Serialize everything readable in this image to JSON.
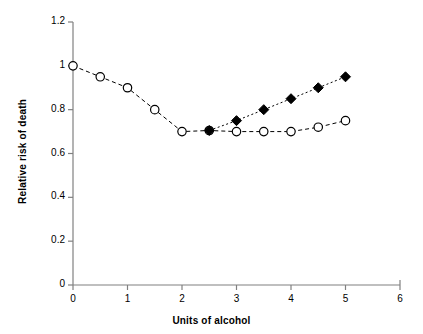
{
  "chart_data": {
    "type": "line",
    "title": "",
    "xlabel": "Units of alcohol",
    "ylabel": "Relative risk of death",
    "xlim": [
      0,
      6
    ],
    "ylim": [
      0,
      1.2
    ],
    "xticks": [
      "0",
      "1",
      "2",
      "3",
      "4",
      "5",
      "6"
    ],
    "xtick_values": [
      0,
      1,
      2,
      3,
      4,
      5,
      6
    ],
    "yticks": [
      "0",
      "0.2",
      "0.4",
      "0.6",
      "0.8",
      "1",
      "1.2"
    ],
    "ytick_values": [
      0,
      0.2,
      0.4,
      0.6,
      0.8,
      1,
      1.2
    ],
    "grid": false,
    "legend": "none",
    "series": [
      {
        "name": "open-circle-series",
        "marker": "open-circle",
        "line_style": "dashed",
        "color": "#000000",
        "x": [
          0,
          0.5,
          1,
          1.5,
          2,
          2.5,
          3,
          3.5,
          4,
          4.5,
          5
        ],
        "values": [
          1.0,
          0.95,
          0.9,
          0.8,
          0.7,
          0.705,
          0.7,
          0.7,
          0.7,
          0.72,
          0.75
        ]
      },
      {
        "name": "filled-diamond-series",
        "marker": "filled-diamond",
        "line_style": "dotted",
        "color": "#000000",
        "x": [
          2.5,
          3,
          3.5,
          4,
          4.5,
          5
        ],
        "values": [
          0.705,
          0.75,
          0.8,
          0.85,
          0.9,
          0.95
        ]
      }
    ]
  },
  "axes": {
    "x_title": "Units of alcohol",
    "y_title": "Relative risk of death"
  }
}
